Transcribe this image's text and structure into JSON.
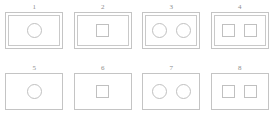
{
  "page": {
    "background_color": "#ffffff",
    "stroke_color": "#c4c4c4",
    "label_color": "#8e8e8e",
    "columns": 4,
    "rows": 2
  },
  "panels": [
    {
      "label": "1",
      "frame_style": "double",
      "shape": "circle",
      "shape_count": 1
    },
    {
      "label": "2",
      "frame_style": "double",
      "shape": "square",
      "shape_count": 1
    },
    {
      "label": "3",
      "frame_style": "double",
      "shape": "circle",
      "shape_count": 2
    },
    {
      "label": "4",
      "frame_style": "double",
      "shape": "square",
      "shape_count": 2
    },
    {
      "label": "5",
      "frame_style": "single",
      "shape": "circle",
      "shape_count": 1
    },
    {
      "label": "6",
      "frame_style": "single",
      "shape": "square",
      "shape_count": 1
    },
    {
      "label": "7",
      "frame_style": "single",
      "shape": "circle",
      "shape_count": 2
    },
    {
      "label": "8",
      "frame_style": "single",
      "shape": "square",
      "shape_count": 2
    }
  ]
}
